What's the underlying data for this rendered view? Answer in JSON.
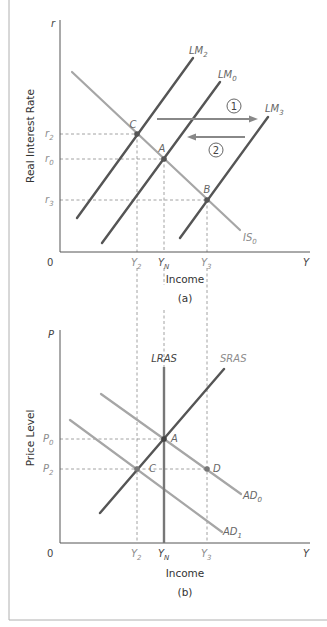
{
  "panel_a": {
    "caption": "(a)",
    "y_axis_symbol": "r",
    "x_axis_symbol": "Y",
    "origin": "0",
    "y_axis_title": "Real Interest Rate",
    "x_axis_title": "Income",
    "y_ticks": [
      {
        "base": "r",
        "sub": "2"
      },
      {
        "base": "r",
        "sub": "0"
      },
      {
        "base": "r",
        "sub": "3"
      }
    ],
    "x_ticks": [
      {
        "base": "Y",
        "sub": "2"
      },
      {
        "base": "Y",
        "sub": "N"
      },
      {
        "base": "Y",
        "sub": "3"
      }
    ],
    "curves": [
      {
        "base": "LM",
        "sub": "2"
      },
      {
        "base": "LM",
        "sub": "0"
      },
      {
        "base": "LM",
        "sub": "3"
      },
      {
        "base": "IS",
        "sub": "0"
      }
    ],
    "points": [
      "C",
      "A",
      "B"
    ],
    "arrows": [
      "1",
      "2"
    ]
  },
  "panel_b": {
    "caption": "(b)",
    "y_axis_symbol": "P",
    "x_axis_symbol": "Y",
    "origin": "0",
    "y_axis_title": "Price Level",
    "x_axis_title": "Income",
    "y_ticks": [
      {
        "base": "P",
        "sub": "0"
      },
      {
        "base": "P",
        "sub": "2"
      }
    ],
    "x_ticks": [
      {
        "base": "Y",
        "sub": "2"
      },
      {
        "base": "Y",
        "sub": "N"
      },
      {
        "base": "Y",
        "sub": "3"
      }
    ],
    "curves": {
      "lras": "LRAS",
      "sras": "SRAS",
      "ad0": {
        "base": "AD",
        "sub": "0"
      },
      "ad1": {
        "base": "AD",
        "sub": "1"
      }
    },
    "points": [
      "A",
      "C",
      "D"
    ]
  },
  "colors": {
    "dark_line": "#555555",
    "light_line": "#a6a6a6",
    "axis": "#555555",
    "dashed": "#8a8a8a",
    "label_gray": "#8c8c8c",
    "text": "#333333",
    "border": "#a0a0a0"
  }
}
